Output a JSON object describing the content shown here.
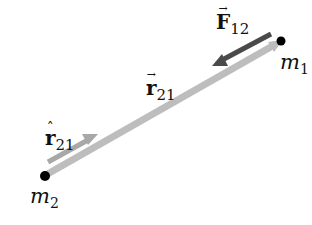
{
  "diagram": {
    "type": "physics-vector-diagram",
    "masses": [
      {
        "id": "m1",
        "symbol": "m",
        "subscript": "1",
        "position": [
          281,
          41
        ]
      },
      {
        "id": "m2",
        "symbol": "m",
        "subscript": "2",
        "position": [
          44,
          176
        ]
      }
    ],
    "vectors": [
      {
        "id": "F12",
        "symbol": "F",
        "accent": "→",
        "subscript": "12",
        "label": "F⃗₁₂",
        "color": "#4a4a4a",
        "from": [
          271,
          36
        ],
        "to": [
          214,
          64
        ]
      },
      {
        "id": "r21",
        "symbol": "r",
        "accent": "→",
        "subscript": "21",
        "label": "r⃗₂₁",
        "color": "#b8b8b8",
        "from": [
          44,
          176
        ],
        "to": [
          276,
          44
        ]
      },
      {
        "id": "r21_hat",
        "symbol": "r",
        "accent": "^",
        "subscript": "21",
        "label": "r̂₂₁",
        "color": "#a8a8a8",
        "from": [
          50,
          168
        ],
        "to": [
          97,
          143
        ]
      }
    ],
    "colors": {
      "force_arrow": "#4a4a4a",
      "position_shaft": "#bdbdbd",
      "unit_arrow": "#a8a8a8",
      "mass_dot": "#000000"
    }
  },
  "labels": {
    "F12": {
      "symbol": "F",
      "accent": "→",
      "subscript": "12"
    },
    "r21": {
      "symbol": "r",
      "accent": "→",
      "subscript": "21"
    },
    "r21_hat": {
      "symbol": "r",
      "accent": "ˆ",
      "subscript": "21"
    },
    "m1": {
      "symbol": "m",
      "subscript": "1"
    },
    "m2": {
      "symbol": "m",
      "subscript": "2"
    }
  }
}
